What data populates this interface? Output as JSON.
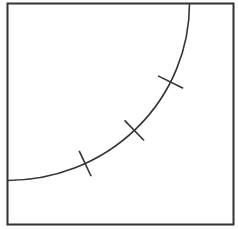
{
  "diagram": {
    "stroke_color": "#333333",
    "background_color": "#ffffff",
    "arc": {
      "span": "quarter circle",
      "tick_count": 3
    },
    "ticks": [
      {
        "label": ""
      },
      {
        "label": ""
      },
      {
        "label": ""
      }
    ]
  }
}
